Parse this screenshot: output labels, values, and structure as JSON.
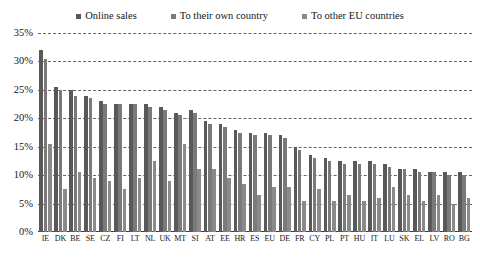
{
  "chart_data": {
    "type": "bar",
    "title": "",
    "subtitle": "",
    "xlabel": "",
    "ylabel": "",
    "ylim": [
      0,
      35
    ],
    "ytick_step": 5,
    "ytick_labels": [
      "35%",
      "30%",
      "25%",
      "20%",
      "15%",
      "10%",
      "5%",
      "0%"
    ],
    "ytick_values": [
      35,
      30,
      25,
      20,
      15,
      10,
      5,
      0
    ],
    "grid": true,
    "grid_style": "dashed-horizontal",
    "legend_position": "top-center",
    "categories": [
      "IE",
      "DK",
      "BE",
      "SE",
      "CZ",
      "FI",
      "LT",
      "NL",
      "UK",
      "MT",
      "SI",
      "AT",
      "EE",
      "HR",
      "ES",
      "EU",
      "DE",
      "FR",
      "CY",
      "PL",
      "PT",
      "HU",
      "IT",
      "LU",
      "SK",
      "EL",
      "LV",
      "RO",
      "BG"
    ],
    "series": [
      {
        "name": "Online sales",
        "color": "#595959",
        "values": [
          32.0,
          25.5,
          25.0,
          24.0,
          23.0,
          22.5,
          22.5,
          22.5,
          22.0,
          21.0,
          21.5,
          19.5,
          19.0,
          18.0,
          17.5,
          17.5,
          17.0,
          15.0,
          13.5,
          13.0,
          12.5,
          12.5,
          12.5,
          12.0,
          11.0,
          11.0,
          10.5,
          10.5,
          10.5
        ]
      },
      {
        "name": "To their own country",
        "color": "#7a7a7a",
        "values": [
          30.5,
          25.0,
          24.0,
          23.5,
          22.5,
          22.5,
          22.5,
          22.0,
          21.5,
          20.5,
          21.0,
          19.0,
          18.5,
          17.5,
          17.0,
          17.0,
          16.5,
          14.5,
          13.0,
          12.5,
          12.0,
          12.0,
          12.0,
          11.5,
          11.0,
          10.5,
          10.5,
          10.0,
          10.0
        ]
      },
      {
        "name": "To other EU countries",
        "color": "#8a8a8a",
        "values": [
          15.5,
          7.5,
          10.5,
          9.5,
          9.0,
          7.5,
          9.5,
          12.5,
          9.0,
          15.5,
          11.0,
          11.0,
          9.5,
          8.5,
          6.5,
          8.0,
          8.0,
          5.5,
          7.5,
          5.5,
          6.5,
          5.5,
          6.0,
          8.0,
          6.5,
          5.5,
          6.5,
          5.0,
          6.0
        ]
      }
    ]
  },
  "legend": {
    "items": [
      {
        "label": "Online sales",
        "color": "#595959"
      },
      {
        "label": "To their own country",
        "color": "#7a7a7a"
      },
      {
        "label": "To other EU countries",
        "color": "#8a8a8a"
      }
    ]
  }
}
